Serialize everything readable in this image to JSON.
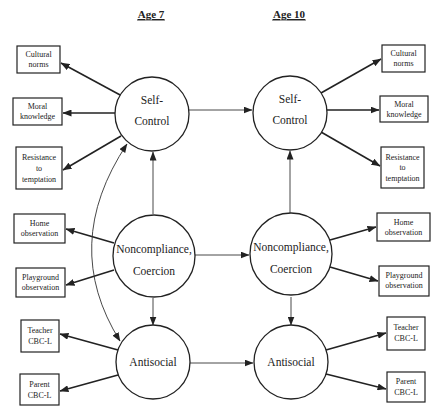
{
  "headers": {
    "left": "Age 7",
    "right": "Age 10"
  },
  "latent": {
    "self_control": {
      "line1": "Self-",
      "line2": "Control"
    },
    "noncompliance": {
      "line1": "Noncompliance,",
      "line2": "Coercion"
    },
    "antisocial": {
      "line1": "Antisocial"
    }
  },
  "indicators": {
    "cultural_norms": {
      "line1": "Cultural",
      "line2": "norms"
    },
    "moral_knowledge": {
      "line1": "Moral",
      "line2": "knowledge"
    },
    "resistance": {
      "line1": "Resistance",
      "line2": "to",
      "line3": "temptation"
    },
    "home_obs": {
      "line1": "Home",
      "line2": "observation"
    },
    "playground_obs": {
      "line1": "Playground",
      "line2": "observation"
    },
    "teacher_cbcl": {
      "line1": "Teacher",
      "line2": "CBC-L"
    },
    "parent_cbcl": {
      "line1": "Parent",
      "line2": "CBC-L"
    }
  },
  "colors": {
    "stroke": "#222222",
    "background": "#ffffff"
  }
}
